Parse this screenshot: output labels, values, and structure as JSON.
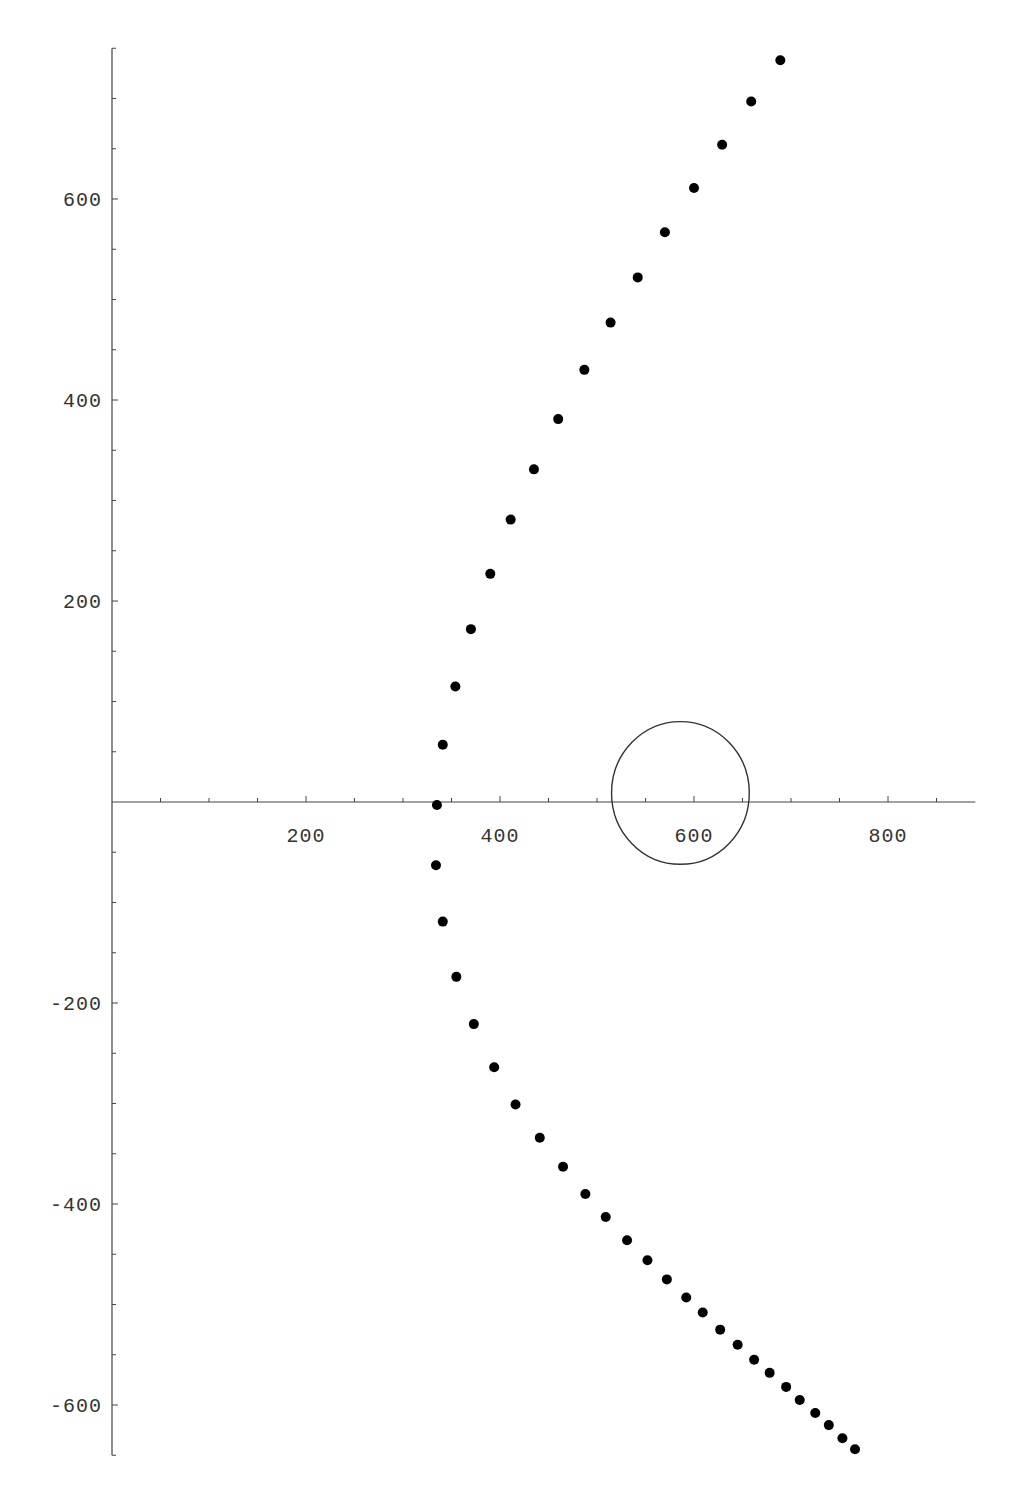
{
  "chart_data": {
    "type": "scatter",
    "title": "",
    "xlabel": "",
    "ylabel": "",
    "xlim": [
      0,
      890
    ],
    "ylim": [
      -650,
      750
    ],
    "grid": false,
    "legend": null,
    "x_ticks": [
      200,
      400,
      600,
      800
    ],
    "x_tick_labels": [
      "200",
      "400",
      "600",
      "800"
    ],
    "x_minor_step": 50,
    "y_ticks": [
      600,
      400,
      200,
      -200,
      -400,
      -600
    ],
    "y_tick_labels": [
      "600",
      "400",
      "200",
      "-200",
      "-400",
      "-600"
    ],
    "y_minor_step": 50,
    "series": [
      {
        "name": "points",
        "marker": "filled-circle",
        "color": "#000000",
        "x": [
          689,
          659,
          629,
          600,
          570,
          542,
          514,
          487,
          460,
          435,
          411,
          390,
          370,
          354,
          341,
          335,
          334,
          341,
          355,
          373,
          394,
          416,
          441,
          465,
          488,
          509,
          531,
          552,
          572,
          592,
          609,
          627,
          645,
          662,
          678,
          695,
          709,
          725,
          739,
          753,
          766
        ],
        "y": [
          738,
          697,
          654,
          611,
          567,
          522,
          477,
          430,
          381,
          331,
          281,
          227,
          172,
          115,
          57,
          -3,
          -63,
          -119,
          -174,
          -221,
          -264,
          -301,
          -334,
          -363,
          -390,
          -413,
          -436,
          -456,
          -475,
          -493,
          -508,
          -525,
          -540,
          -555,
          -568,
          -582,
          -595,
          -608,
          -620,
          -633,
          -644
        ]
      }
    ],
    "annotations": [
      {
        "type": "circle",
        "center": [
          586,
          9
        ],
        "radius": 71,
        "stroke": "#333333",
        "fill": "none"
      }
    ]
  }
}
